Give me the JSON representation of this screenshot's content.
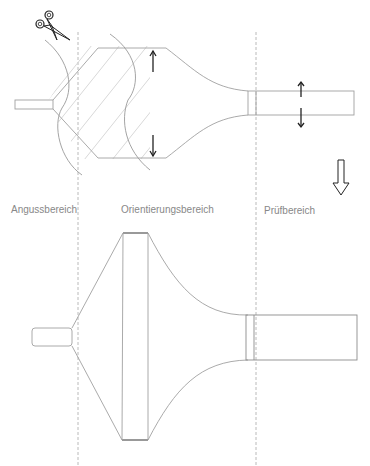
{
  "diagram": {
    "regions": [
      {
        "id": "gate",
        "label": "Angussbereich"
      },
      {
        "id": "orientation",
        "label": "Orientierungsbereich"
      },
      {
        "id": "test",
        "label": "Prüfbereich"
      }
    ],
    "icons": {
      "scissors": "scissors-icon",
      "transition_arrow": "down-hollow-arrow-icon",
      "expansion_arrows": "up-down-arrow-icon"
    },
    "colors": {
      "outline": "#a0a0a0",
      "hatch": "#d4d4d4",
      "guide": "#a8a8a8",
      "arrow": "#222222",
      "label": "#888888"
    }
  }
}
